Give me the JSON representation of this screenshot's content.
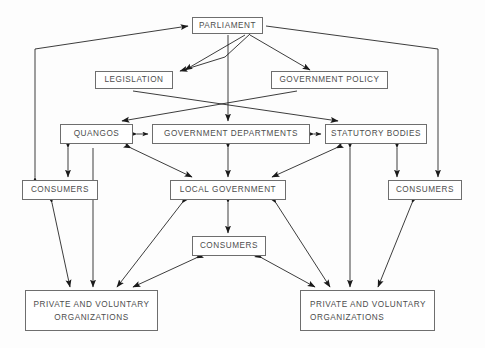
{
  "diagram": {
    "style": {
      "background": "#fdfdfd",
      "box_border": "#6e6e6e",
      "box_fill": "#ffffff",
      "text_color": "#4d4d4d",
      "line_color": "#1a1a1a"
    },
    "nodes": [
      {
        "id": "parliament",
        "label": "PARLIAMENT",
        "x": 192,
        "y": 17,
        "w": 71,
        "h": 17,
        "align": "center"
      },
      {
        "id": "legislation",
        "label": "LEGISLATION",
        "x": 95,
        "y": 71,
        "w": 78,
        "h": 18,
        "align": "center"
      },
      {
        "id": "gov-policy",
        "label": "GOVERNMENT POLICY",
        "x": 271,
        "y": 71,
        "w": 117,
        "h": 18,
        "align": "center"
      },
      {
        "id": "quangos",
        "label": "QUANGOS",
        "x": 60,
        "y": 124,
        "w": 73,
        "h": 20,
        "align": "center"
      },
      {
        "id": "gov-departments",
        "label": "GOVERNMENT DEPARTMENTS",
        "x": 152,
        "y": 124,
        "w": 158,
        "h": 20,
        "align": "center"
      },
      {
        "id": "statutory",
        "label": "STATUTORY BODIES",
        "x": 325,
        "y": 124,
        "w": 102,
        "h": 20,
        "align": "center"
      },
      {
        "id": "consumers-left",
        "label": "CONSUMERS",
        "x": 22,
        "y": 180,
        "w": 76,
        "h": 20,
        "align": "center"
      },
      {
        "id": "local-gov",
        "label": "LOCAL GOVERNMENT",
        "x": 170,
        "y": 180,
        "w": 116,
        "h": 20,
        "align": "center"
      },
      {
        "id": "consumers-right",
        "label": "CONSUMERS",
        "x": 388,
        "y": 180,
        "w": 74,
        "h": 20,
        "align": "center"
      },
      {
        "id": "consumers-mid",
        "label": "CONSUMERS",
        "x": 192,
        "y": 236,
        "w": 74,
        "h": 20,
        "align": "center"
      },
      {
        "id": "pvo-left",
        "label": "PRIVATE AND VOLUNTARY\nORGANIZATIONS",
        "x": 25,
        "y": 290,
        "w": 133,
        "h": 41,
        "align": "center"
      },
      {
        "id": "pvo-right",
        "label": "PRIVATE AND VOLUNTARY\nORGANIZATIONS",
        "x": 300,
        "y": 290,
        "w": 135,
        "h": 41,
        "align": "left"
      }
    ],
    "edges": [
      {
        "id": "e-legislation-parliament",
        "from": "parliament",
        "to": "legislation",
        "points": "250,34 225,57 180,71",
        "arrows": "both_ends_single",
        "heads": [
          "end"
        ]
      },
      {
        "id": "e-parliament-legislation",
        "points": "245,35 185,70",
        "heads": [
          "end"
        ]
      },
      {
        "id": "e-parliament-govpolicy",
        "points": "250,35 310,70",
        "heads": [
          "end"
        ]
      },
      {
        "id": "e-legislation-govdept",
        "points": "133,91 338,121",
        "heads": [
          "end"
        ]
      },
      {
        "id": "e-govpolicy-quangos",
        "points": "297,91 122,121",
        "heads": [
          "end"
        ]
      },
      {
        "id": "e-parliament-govdept",
        "points": "228,35 228,121",
        "heads": [
          "end"
        ]
      },
      {
        "id": "e-quangos-govdept",
        "points": "137,134 148,134",
        "heads": [
          "both"
        ]
      },
      {
        "id": "e-govdept-statutory",
        "points": "314,134 321,134",
        "heads": [
          "both"
        ]
      },
      {
        "id": "e-quangos-consumersleft",
        "points": "68,148 68,177",
        "heads": [
          "both"
        ]
      },
      {
        "id": "e-quangos-pvoleft",
        "points": "93,148 93,287",
        "heads": [
          "end"
        ]
      },
      {
        "id": "e-quangos-localgov",
        "points": "131,148 192,177",
        "heads": [
          "both"
        ]
      },
      {
        "id": "e-govdept-localgov",
        "points": "228,148 228,177",
        "heads": [
          "both"
        ]
      },
      {
        "id": "e-statutory-localgov",
        "points": "336,148 272,177",
        "heads": [
          "both"
        ]
      },
      {
        "id": "e-statutory-pvoright",
        "points": "350,148 350,287",
        "heads": [
          "both"
        ]
      },
      {
        "id": "e-statutory-consumersright",
        "points": "397,148 397,177",
        "heads": [
          "both"
        ]
      },
      {
        "id": "e-consumersleft-pvoleft",
        "points": "52,203 70,287",
        "heads": [
          "both"
        ]
      },
      {
        "id": "e-localgov-consumersmid",
        "points": "228,203 228,233",
        "heads": [
          "both"
        ]
      },
      {
        "id": "e-localgov-pvoleft",
        "points": "182,203 117,287",
        "heads": [
          "both"
        ]
      },
      {
        "id": "e-localgov-pvoright",
        "points": "276,203 330,287",
        "heads": [
          "both"
        ]
      },
      {
        "id": "e-consumersmid-pvoleft",
        "points": "196,258 133,287",
        "heads": [
          "both"
        ]
      },
      {
        "id": "e-consumersmid-pvoright",
        "points": "262,258 315,287",
        "heads": [
          "both"
        ]
      },
      {
        "id": "e-consumersright-pvoright",
        "points": "412,203 378,287",
        "heads": [
          "both"
        ]
      },
      {
        "id": "e-consumersleft-parliament",
        "points": "35,177 35,49 188,26",
        "heads": [
          "both_poly"
        ]
      },
      {
        "id": "e-parliament-consumersright",
        "points": "266,26 438,49 438,177",
        "heads": [
          "end"
        ]
      }
    ],
    "arrow_count": 24
  }
}
